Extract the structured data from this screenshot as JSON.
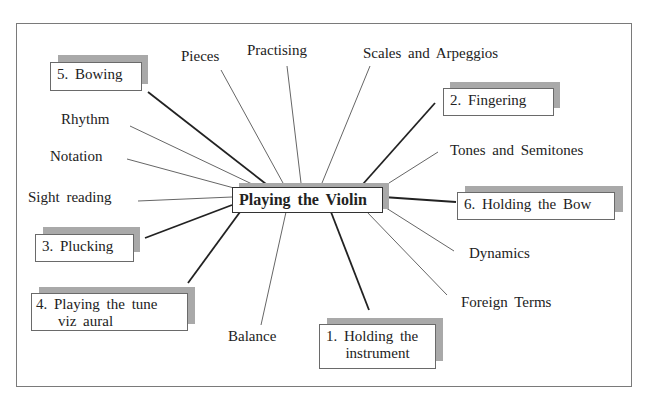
{
  "diagram": {
    "title": "Playing the Violin",
    "numbered_topics": [
      {
        "id": "holding-instrument",
        "label_line1": "1.  Holding the",
        "label_line2": "instrument"
      },
      {
        "id": "fingering",
        "label": "2.  Fingering"
      },
      {
        "id": "plucking",
        "label": "3.  Plucking"
      },
      {
        "id": "playing-tune",
        "label_line1": "4.  Playing the tune",
        "label_line2": "viz aural"
      },
      {
        "id": "bowing",
        "label": "5.  Bowing"
      },
      {
        "id": "holding-bow",
        "label": "6.  Holding the Bow"
      }
    ],
    "other_topics": [
      {
        "id": "pieces",
        "label": "Pieces"
      },
      {
        "id": "practising",
        "label": "Practising"
      },
      {
        "id": "scales",
        "label": "Scales and Arpeggios"
      },
      {
        "id": "rhythm",
        "label": "Rhythm"
      },
      {
        "id": "notation",
        "label": "Notation"
      },
      {
        "id": "sight-reading",
        "label": "Sight reading"
      },
      {
        "id": "tones",
        "label": "Tones and Semitones"
      },
      {
        "id": "dynamics",
        "label": "Dynamics"
      },
      {
        "id": "foreign-terms",
        "label": "Foreign Terms"
      },
      {
        "id": "balance",
        "label": "Balance"
      }
    ]
  },
  "colors": {
    "frame": "#7a7a7a",
    "shadow": "#a9a9a9",
    "thick_line": "#222222",
    "thin_line": "#666666"
  }
}
